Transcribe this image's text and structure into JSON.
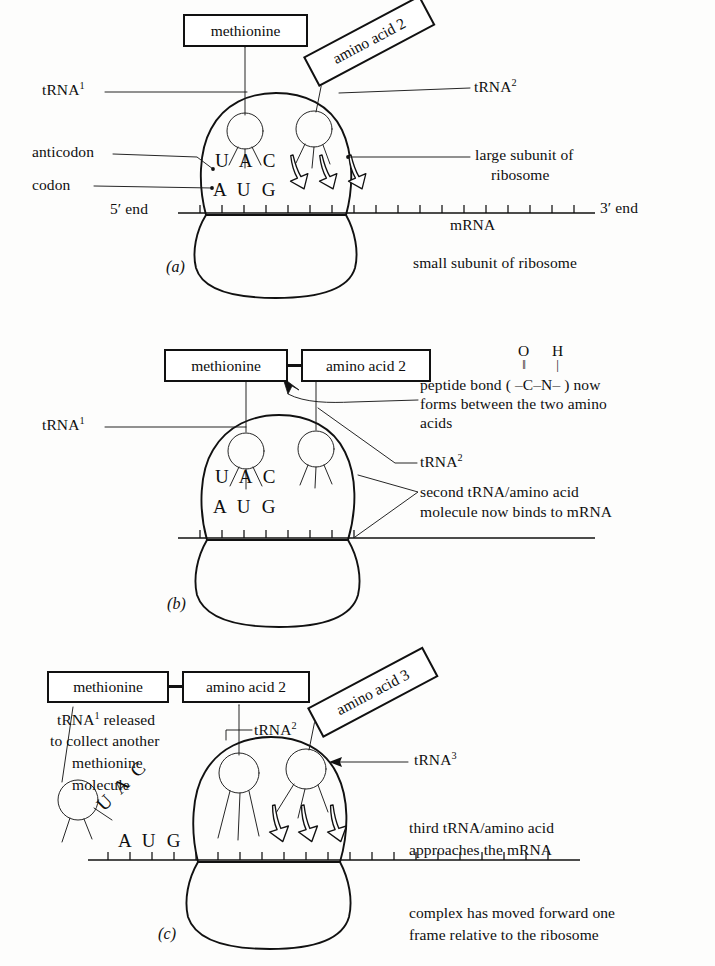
{
  "figure": {
    "background_color": "#fdfdfc",
    "ink_color": "#111111"
  },
  "panels": [
    {
      "id": "a",
      "label": "(a)",
      "boxes": [
        {
          "name": "methionine-box",
          "text": "methionine",
          "rotation_deg": 0
        },
        {
          "name": "amino-acid-2-box",
          "text": "amino acid 2",
          "rotation_deg": -28
        }
      ],
      "labels": {
        "trna1": "tRNA",
        "trna1_sup": "1",
        "trna2": "tRNA",
        "trna2_sup": "2",
        "anticodon": "anticodon",
        "codon": "codon",
        "five_prime": "5′ end",
        "three_prime": "3′ end",
        "mrna": "mRNA",
        "large_subunit_line1": "large subunit of",
        "large_subunit_line2": "ribosome",
        "small_subunit": "small subunit of ribosome"
      },
      "sequences": {
        "anticodon_bases": "U A C",
        "codon_bases": "A U G"
      }
    },
    {
      "id": "b",
      "label": "(b)",
      "boxes": [
        {
          "name": "methionine-box",
          "text": "methionine",
          "rotation_deg": 0
        },
        {
          "name": "amino-acid-2-box",
          "text": "amino acid 2",
          "rotation_deg": 0
        }
      ],
      "labels": {
        "trna1": "tRNA",
        "trna1_sup": "1",
        "trna2": "tRNA",
        "trna2_sup": "2"
      },
      "sequences": {
        "anticodon_bases": "U A C",
        "codon_bases": "A U G"
      },
      "notes": {
        "peptide_bond_prefix": "peptide bond ( –",
        "peptide_bond_middle": "–",
        "peptide_bond_suffix": "– ) now",
        "peptide_bond_atom1": "C",
        "peptide_bond_atom2": "N",
        "peptide_bond_top1": "O",
        "peptide_bond_top2": "H",
        "peptide_bond_bond1": "‖",
        "peptide_bond_bond2": "|",
        "peptide_bond_line2": "forms between the two amino",
        "peptide_bond_line3": "acids",
        "second_trna_line1": "second tRNA/amino acid",
        "second_trna_line2": "molecule now binds to mRNA"
      }
    },
    {
      "id": "c",
      "label": "(c)",
      "boxes": [
        {
          "name": "methionine-box",
          "text": "methionine",
          "rotation_deg": 0
        },
        {
          "name": "amino-acid-2-box",
          "text": "amino acid 2",
          "rotation_deg": 0
        },
        {
          "name": "amino-acid-3-box",
          "text": "amino acid 3",
          "rotation_deg": -28
        }
      ],
      "labels": {
        "trna1": "tRNA",
        "trna1_sup": "1",
        "trna2": "tRNA",
        "trna2_sup": "2",
        "trna3": "tRNA",
        "trna3_sup": "3"
      },
      "sequences": {
        "released_anticodon_bases": "U A C",
        "codon_bases": "A U G"
      },
      "notes": {
        "released_line1_a": "tRNA",
        "released_line1_sup": "1",
        "released_line1_b": " released",
        "released_line2": "to collect another",
        "released_line3": "methionine",
        "released_line4": "molecule",
        "third_trna_line1": "third tRNA/amino acid",
        "third_trna_line2": "approaches the mRNA",
        "moved_line1": "complex has moved forward one",
        "moved_line2": "frame relative to the ribosome"
      }
    }
  ]
}
